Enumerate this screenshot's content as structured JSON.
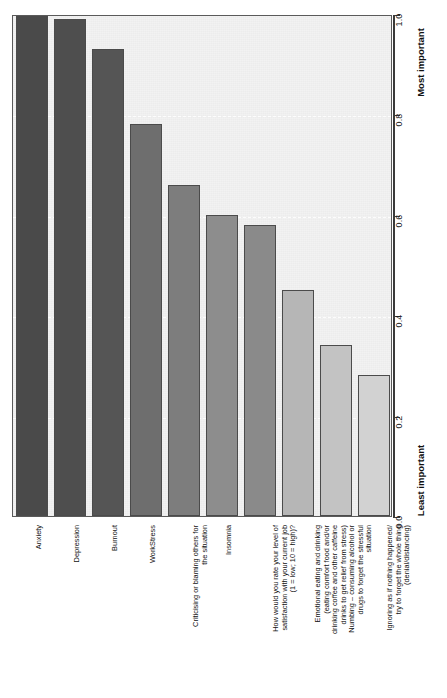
{
  "chart_data": {
    "type": "bar",
    "orientation": "vertical-rotated",
    "title": "",
    "subtitle": "",
    "xlabel": "",
    "ylabel": "",
    "ylim": [
      0.0,
      1.0
    ],
    "grid": true,
    "grid_axis": "y",
    "legend": "none",
    "axis_low_caption": "Least important",
    "axis_high_caption": "Most important",
    "tick_labels": [
      "0.0",
      "0.2",
      "0.4",
      "0.6",
      "0.8",
      "1.0"
    ],
    "tick_values": [
      0.0,
      0.2,
      0.4,
      0.6,
      0.8,
      1.0
    ],
    "categories": [
      "Anxiety",
      "Depression",
      "Burnout",
      "WorkStress",
      "Criticising or blaming others for\nthe situation",
      "Insomnia",
      "How would you rate your level of\nsatisfaction with your current job\n(1 = low; 10 = high)?",
      "Emotional eating and drinking\n(eating comfort food and/or\ndrinking coffee and other caffeine\ndrinks to get relief from stress)",
      "Numbing – consuming alcohol or\ndrugs to forget the stressful\nsituation",
      "Ignoring as if nothing happened/\ntry to forget the whole thing\n(denial/distancing)"
    ],
    "values": [
      1.0,
      0.99,
      0.93,
      0.78,
      0.66,
      0.6,
      0.58,
      0.45,
      0.34,
      0.28
    ],
    "bar_colors": [
      "#4a4a4a",
      "#4e4e4e",
      "#555555",
      "#6e6e6e",
      "#7d7d7d",
      "#8d8d8d",
      "#8a8a8a",
      "#b6b6b6",
      "#c3c3c3",
      "#d2d2d2"
    ],
    "bar_border_color": "#4b4b4b",
    "panel_background": "#f2f2f2",
    "gridline_color": "#ffffff",
    "axis_color": "#3a3a3a"
  }
}
